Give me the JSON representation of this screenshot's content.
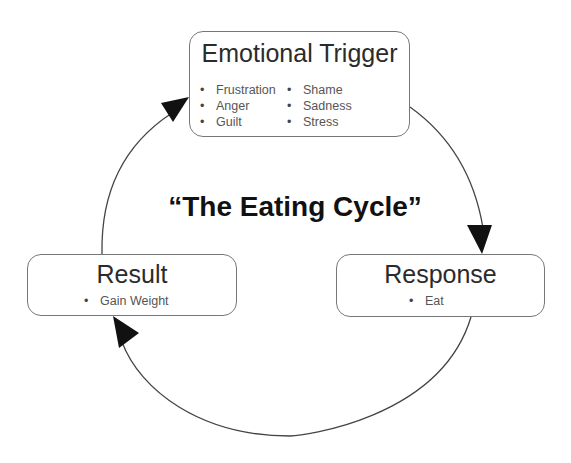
{
  "diagram": {
    "title": "“The Eating Cycle”",
    "nodes": {
      "trigger": {
        "title": "Emotional Trigger",
        "items_col1": [
          "Frustration",
          "Anger",
          "Guilt"
        ],
        "items_col2": [
          "Shame",
          "Sadness",
          "Stress"
        ]
      },
      "response": {
        "title": "Response",
        "items": [
          "Eat"
        ]
      },
      "result": {
        "title": "Result",
        "items": [
          "Gain Weight"
        ]
      }
    },
    "edges": [
      {
        "from": "Emotional Trigger",
        "to": "Response"
      },
      {
        "from": "Response",
        "to": "Result"
      },
      {
        "from": "Result",
        "to": "Emotional Trigger"
      }
    ],
    "colors": {
      "line": "#444444",
      "arrowhead": "#111111",
      "box_border": "#777777"
    }
  }
}
